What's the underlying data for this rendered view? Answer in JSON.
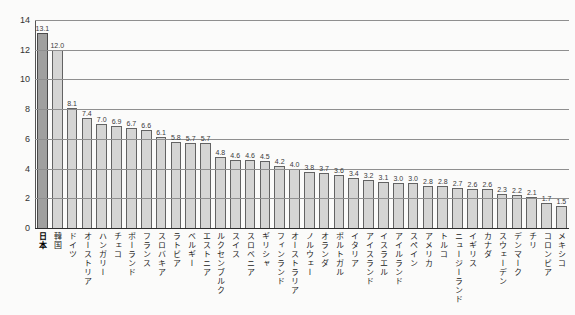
{
  "chart_data": {
    "type": "bar",
    "title": "",
    "xlabel": "",
    "ylabel": "",
    "categories": [
      "日本",
      "韓国",
      "ドイツ",
      "オーストリア",
      "ハンガリー",
      "チェコ",
      "ポーランド",
      "フランス",
      "スロバキア",
      "ラトビア",
      "ベルギー",
      "エストニア",
      "ルクセンブルク",
      "スイス",
      "スロベニア",
      "ギリシャ",
      "フィンランド",
      "オーストラリア",
      "ノルウェー",
      "オランダ",
      "ポルトガル",
      "イタリア",
      "アイスランド",
      "イスラエル",
      "アイルランド",
      "スペイン",
      "アメリカ",
      "トルコ",
      "ニュージーランド",
      "イギリス",
      "カナダ",
      "スウェーデン",
      "デンマーク",
      "チリ",
      "コロンビア",
      "メキシコ"
    ],
    "values": [
      13.1,
      12.0,
      8.1,
      7.4,
      7.0,
      6.9,
      6.7,
      6.6,
      6.1,
      5.8,
      5.7,
      5.7,
      4.8,
      4.6,
      4.6,
      4.5,
      4.2,
      4.0,
      3.8,
      3.7,
      3.6,
      3.4,
      3.2,
      3.1,
      3.0,
      3.0,
      2.8,
      2.8,
      2.7,
      2.6,
      2.6,
      2.3,
      2.2,
      2.1,
      1.7,
      1.5
    ],
    "ylim": [
      0,
      14
    ],
    "yticks": [
      0,
      2,
      4,
      6,
      8,
      10,
      12,
      14
    ],
    "grid": true,
    "legend_position": "none",
    "highlight_category": "日本",
    "value_label_decimals": 1
  },
  "colors": {
    "background": "#fbfbfa",
    "bar_fill": "#d5d5d4",
    "bar_fill_highlight": "#a0a09f",
    "bar_border": "#636363",
    "gridline": "#8f8f8f",
    "axis": "#2c2c2c",
    "text": "#222222"
  }
}
